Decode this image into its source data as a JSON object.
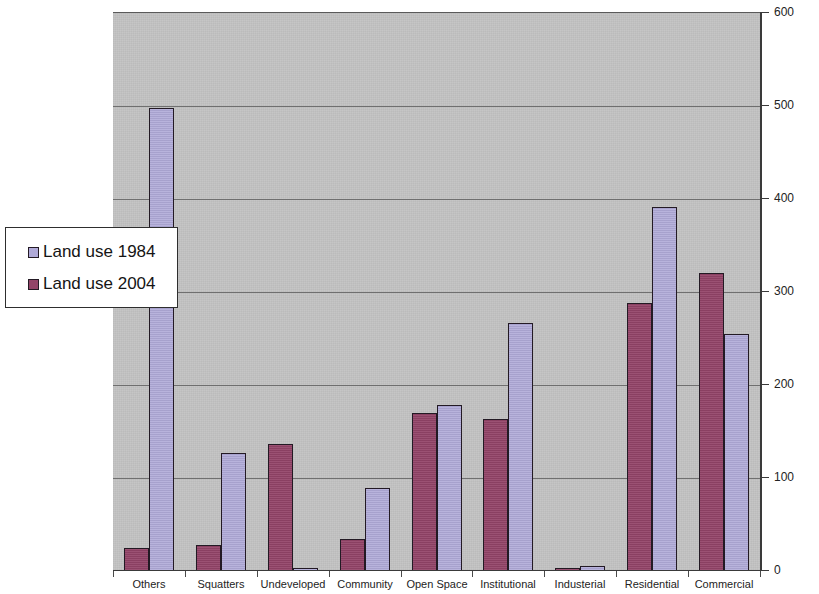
{
  "chart_data": {
    "type": "bar",
    "title": "",
    "subtitle": "",
    "xlabel": "",
    "ylabel": "",
    "ylim": [
      0,
      600
    ],
    "y_ticks": [
      0,
      100,
      200,
      300,
      400,
      500,
      600
    ],
    "grid": true,
    "legend_position": "left-middle",
    "categories": [
      "Others",
      "Squatters",
      "Undeveloped",
      "Community",
      "Open Space",
      "Institutional",
      "Industerial",
      "Residential",
      "Commercial"
    ],
    "series": [
      {
        "name": "Land use 2004",
        "color": "#934468",
        "values": [
          25,
          28,
          137,
          34,
          170,
          163,
          2,
          288,
          320
        ]
      },
      {
        "name": "Land use 1984",
        "color": "#b0aad8",
        "values": [
          498,
          127,
          0,
          89,
          178,
          267,
          5,
          391,
          255
        ]
      }
    ]
  },
  "legend": {
    "items": [
      {
        "label": "Land use 1984",
        "swatch": "#b0aad8"
      },
      {
        "label": "Land use 2004",
        "swatch": "#934468"
      }
    ]
  },
  "plot": {
    "background_color": "#c3c3c3",
    "gridline_color": "#6f6f6f",
    "axis_color": "#3a3a3a"
  }
}
